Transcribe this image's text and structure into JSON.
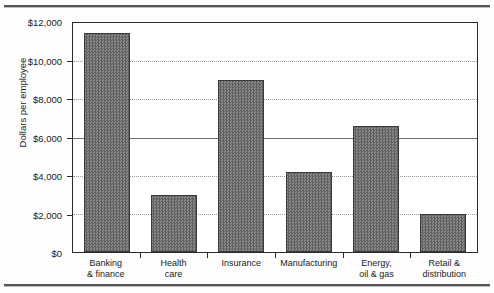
{
  "page": {
    "bleed_text": "· ·· ···",
    "background_color": "#fdfdfd",
    "rule_color": "#555555"
  },
  "chart_data": {
    "type": "bar",
    "title": "",
    "xlabel": "",
    "ylabel": "Dollars per employee",
    "categories": [
      "Banking & finance",
      "Health care",
      "Insurance",
      "Manufacturing",
      "Energy, oil & gas",
      "Retail & distribution"
    ],
    "category_lines": [
      [
        "Banking",
        "& finance"
      ],
      [
        "Health",
        "care"
      ],
      [
        "Insurance",
        ""
      ],
      [
        "Manufacturing",
        ""
      ],
      [
        "Energy,",
        "oil & gas"
      ],
      [
        "Retail &",
        "distribution"
      ]
    ],
    "values": [
      11500,
      3000,
      9000,
      4200,
      6600,
      1980
    ],
    "ylim": [
      0,
      12000
    ],
    "ytick_values": [
      12000,
      10000,
      8000,
      6000,
      4000,
      2000,
      0
    ],
    "ytick_labels": [
      "$12,000",
      "$10,000",
      "$8,000",
      "$6,000",
      "$4,000",
      "$2,000",
      "$0"
    ],
    "grid": true,
    "grid_style": "dotted horizontal",
    "legend": "none",
    "bar_color": "#737373",
    "bar_edge_color": "#3a3a3a",
    "axis_color": "#2b2b2b"
  }
}
